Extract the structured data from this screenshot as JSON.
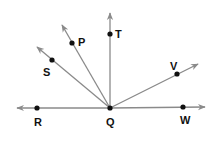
{
  "diagram": {
    "type": "angles-from-common-vertex",
    "vertex": {
      "name": "Q",
      "x": 110,
      "y": 108,
      "label_x": 106,
      "label_y": 126
    },
    "line_color": "#8a8a8a",
    "point_color": "#111111",
    "points": [
      {
        "name": "R",
        "x": 37,
        "y": 108,
        "label_x": 34,
        "label_y": 126
      },
      {
        "name": "W",
        "x": 183,
        "y": 107,
        "label_x": 180,
        "label_y": 124
      },
      {
        "name": "T",
        "x": 110,
        "y": 34,
        "label_x": 115,
        "label_y": 38
      },
      {
        "name": "P",
        "x": 72,
        "y": 43,
        "label_x": 78,
        "label_y": 46
      },
      {
        "name": "S",
        "x": 52,
        "y": 60,
        "label_x": 43,
        "label_y": 76
      },
      {
        "name": "V",
        "x": 177,
        "y": 74,
        "label_x": 170,
        "label_y": 70
      }
    ],
    "rays": [
      {
        "name": "ray-QR",
        "to_x": 17,
        "to_y": 108
      },
      {
        "name": "ray-QW",
        "to_x": 205,
        "to_y": 107
      },
      {
        "name": "ray-QT",
        "to_x": 110,
        "to_y": 13
      },
      {
        "name": "ray-QP",
        "to_x": 62,
        "to_y": 25
      },
      {
        "name": "ray-QS",
        "to_x": 37,
        "to_y": 47
      },
      {
        "name": "ray-QV",
        "to_x": 198,
        "to_y": 64
      }
    ]
  }
}
